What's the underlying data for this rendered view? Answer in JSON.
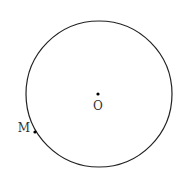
{
  "diagram": {
    "circle": {
      "cx": 99,
      "cy": 94,
      "r": 73,
      "stroke": "#222222"
    },
    "points": [
      {
        "id": "O",
        "label": "O",
        "x": 98,
        "y": 94,
        "label_x": 98,
        "label_y": 110
      },
      {
        "id": "M",
        "label": "M",
        "x": 35,
        "y": 132,
        "label_x": 24,
        "label_y": 132
      }
    ]
  }
}
